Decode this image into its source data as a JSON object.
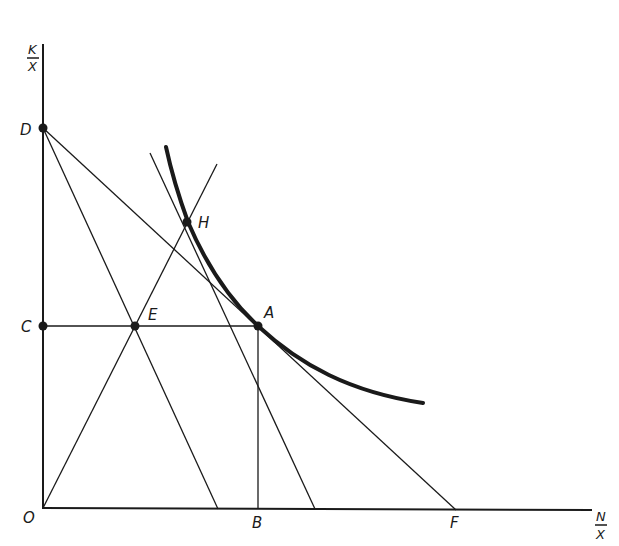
{
  "diagram": {
    "axes": {
      "y_label_numerator": "K",
      "y_label_denominator": "X",
      "x_label_numerator": "N",
      "x_label_denominator": "X"
    },
    "points": {
      "O": "O",
      "B": "B",
      "F": "F",
      "C": "C",
      "D": "D",
      "E": "E",
      "A": "A",
      "H": "H"
    },
    "colors": {
      "ink": "#1a1a1a",
      "background": "#ffffff"
    }
  }
}
